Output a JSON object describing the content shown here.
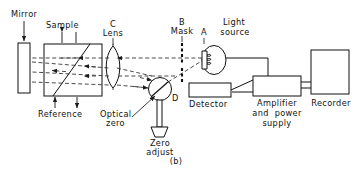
{
  "figure": {
    "caption": "(b)",
    "type": "optical-schematic"
  },
  "labels": {
    "mirror": "Mirror",
    "sample": "Sample",
    "reference": "Reference",
    "lens_letter": "C",
    "lens": "Lens",
    "mask_letter": "B",
    "mask": "Mask",
    "source_letter": "A",
    "light_source_line1": "Light",
    "light_source_line2": "source",
    "optical_zero_line1": "Optical",
    "optical_zero_line2": "zero",
    "zero_adjust_line1": "Zero",
    "zero_adjust_line2": "adjust",
    "chopper_letter": "D",
    "detector": "Detector",
    "amplifier_line1": "Amplifier",
    "amplifier_line2": "and  power",
    "amplifier_line3": "supply",
    "recorder": "Recorder"
  },
  "components": [
    {
      "id": "mirror",
      "name": "Mirror",
      "shape": "tall-rectangle"
    },
    {
      "id": "cell-block",
      "name": "Sample / Reference cell",
      "shape": "square-with-diagonal"
    },
    {
      "id": "lens",
      "name": "Lens",
      "letter": "C",
      "shape": "biconvex-lens"
    },
    {
      "id": "mask",
      "name": "Mask",
      "letter": "B",
      "shape": "vertical-comb"
    },
    {
      "id": "light-source",
      "name": "Light source",
      "letter": "A",
      "shape": "ellipse-with-filament"
    },
    {
      "id": "optical-zero",
      "name": "Optical zero chopper",
      "letter": "D",
      "shape": "circle-with-diagonal"
    },
    {
      "id": "zero-adjust",
      "name": "Zero adjust knob",
      "shape": "trapezoid-on-shaft"
    },
    {
      "id": "detector",
      "name": "Detector",
      "shape": "rectangle"
    },
    {
      "id": "amplifier",
      "name": "Amplifier and power supply",
      "shape": "rectangle"
    },
    {
      "id": "recorder",
      "name": "Recorder",
      "shape": "rectangle"
    }
  ],
  "colors": {
    "line": "#111111",
    "beam": "#333333",
    "background": "#ffffff"
  }
}
